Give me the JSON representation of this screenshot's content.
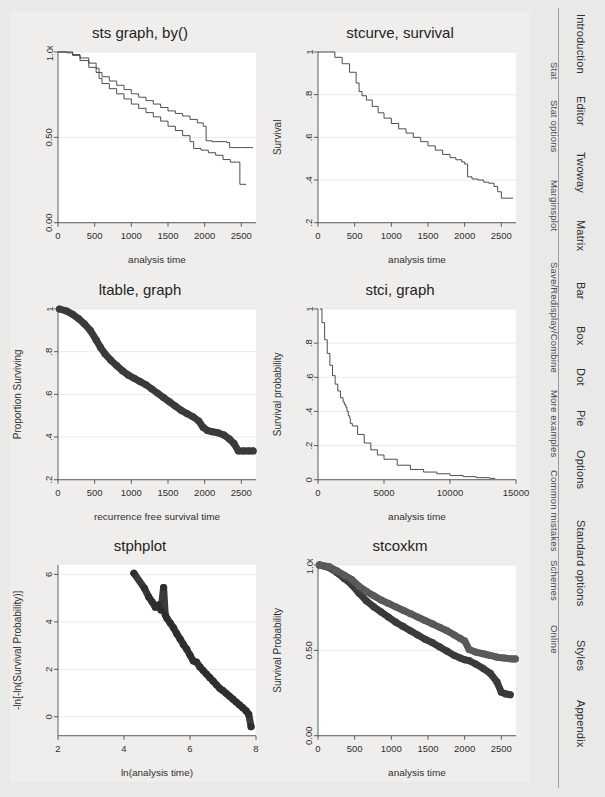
{
  "page": {
    "background_color": "#e9e9e7",
    "panel_color": "#efeeec"
  },
  "tab_rail": {
    "divider_color": "#9b9b9b",
    "outer_tabs": [
      {
        "label": "Introduction"
      },
      {
        "label": "Editor"
      },
      {
        "label": "Twoway"
      },
      {
        "label": "Matrix"
      },
      {
        "label": "Bar"
      },
      {
        "label": "Box"
      },
      {
        "label": "Dot"
      },
      {
        "label": "Pie"
      },
      {
        "label": "Options"
      },
      {
        "label": "Standard options"
      },
      {
        "label": "Styles"
      },
      {
        "label": "Appendix"
      }
    ],
    "inner_tabs": [
      {
        "label": "Stat"
      },
      {
        "label": "Stat options"
      },
      {
        "label": "Marginsplot"
      },
      {
        "label": "Save/Redisplay/Combine"
      },
      {
        "label": "More examples"
      },
      {
        "label": "Common mistakes"
      },
      {
        "label": "Schemes"
      },
      {
        "label": "Online"
      }
    ]
  },
  "chart_data": [
    {
      "id": "sts-graph-by",
      "type": "line",
      "title": "sts graph, by()",
      "xlabel": "analysis time",
      "ylabel": "",
      "xlim": [
        0,
        2700
      ],
      "ylim": [
        0,
        1.0
      ],
      "xticks": [
        0,
        500,
        1000,
        1500,
        2000,
        2500
      ],
      "xticklabels": [
        "0",
        "500",
        "1000",
        "1500",
        "2000",
        "2500"
      ],
      "yticks": [
        0.0,
        0.5,
        1.0
      ],
      "yticklabels": [
        "0.00",
        "0.50",
        "1.00"
      ],
      "grid": true,
      "legend": "none",
      "series": [
        {
          "name": "group 1",
          "color": "#3b3b3b",
          "x": [
            0,
            120,
            200,
            300,
            420,
            520,
            560,
            600,
            700,
            800,
            900,
            1000,
            1100,
            1200,
            1300,
            1400,
            1500,
            1600,
            1700,
            1800,
            1900,
            1980,
            2020,
            2100,
            2300,
            2340,
            2500,
            2660
          ],
          "y": [
            1.0,
            1.0,
            0.985,
            0.965,
            0.935,
            0.905,
            0.88,
            0.855,
            0.83,
            0.805,
            0.78,
            0.755,
            0.735,
            0.715,
            0.695,
            0.675,
            0.655,
            0.64,
            0.625,
            0.605,
            0.585,
            0.565,
            0.48,
            0.475,
            0.47,
            0.44,
            0.44,
            0.44
          ]
        },
        {
          "name": "group 2",
          "color": "#3b3b3b",
          "x": [
            0,
            120,
            200,
            300,
            420,
            520,
            560,
            600,
            700,
            800,
            900,
            1000,
            1100,
            1200,
            1300,
            1400,
            1500,
            1600,
            1700,
            1800,
            1850,
            1950,
            2050,
            2150,
            2250,
            2350,
            2450,
            2480,
            2560
          ],
          "y": [
            1.0,
            0.995,
            0.98,
            0.95,
            0.91,
            0.88,
            0.845,
            0.815,
            0.785,
            0.755,
            0.725,
            0.695,
            0.67,
            0.645,
            0.62,
            0.595,
            0.565,
            0.54,
            0.51,
            0.475,
            0.435,
            0.425,
            0.41,
            0.395,
            0.37,
            0.355,
            0.355,
            0.225,
            0.22
          ]
        }
      ]
    },
    {
      "id": "stcurve-survival",
      "type": "line",
      "title": "stcurve, survival",
      "xlabel": "analysis time",
      "ylabel": "Survival",
      "xlim": [
        0,
        2700
      ],
      "ylim": [
        0.2,
        1.0
      ],
      "xticks": [
        0,
        500,
        1000,
        1500,
        2000,
        2500
      ],
      "xticklabels": [
        "0",
        "500",
        "1000",
        "1500",
        "2000",
        "2500"
      ],
      "yticks": [
        0.2,
        0.4,
        0.6,
        0.8,
        1.0
      ],
      "yticklabels": [
        ".2",
        ".4",
        ".6",
        ".8",
        "1"
      ],
      "grid": true,
      "legend": "none",
      "series": [
        {
          "name": "survival",
          "color": "#3b3b3b",
          "x": [
            0,
            140,
            230,
            330,
            430,
            520,
            560,
            600,
            660,
            740,
            820,
            900,
            1000,
            1100,
            1200,
            1300,
            1400,
            1500,
            1600,
            1700,
            1800,
            1880,
            1960,
            2000,
            2040,
            2100,
            2180,
            2260,
            2330,
            2400,
            2450,
            2500,
            2660
          ],
          "y": [
            1.0,
            1.0,
            0.975,
            0.945,
            0.905,
            0.855,
            0.815,
            0.795,
            0.775,
            0.745,
            0.715,
            0.69,
            0.665,
            0.64,
            0.62,
            0.6,
            0.58,
            0.56,
            0.54,
            0.52,
            0.505,
            0.495,
            0.485,
            0.475,
            0.415,
            0.405,
            0.4,
            0.39,
            0.385,
            0.37,
            0.345,
            0.315,
            0.315
          ]
        }
      ]
    },
    {
      "id": "ltable-graph",
      "type": "scatter",
      "title": "ltable, graph",
      "xlabel": "recurrence free survival time",
      "ylabel": "Proportion Surviving",
      "xlim": [
        0,
        2700
      ],
      "ylim": [
        0.2,
        1.0
      ],
      "xticks": [
        0,
        500,
        1000,
        1500,
        2000,
        2500
      ],
      "xticklabels": [
        "0",
        "500",
        "1000",
        "1500",
        "2000",
        "2500"
      ],
      "yticks": [
        0.2,
        0.4,
        0.6,
        0.8,
        1.0
      ],
      "yticklabels": [
        ".2",
        ".4",
        ".6",
        ".8",
        "1"
      ],
      "grid": true,
      "legend": "none",
      "marker": "filled-circle",
      "series": [
        {
          "name": "proportion surviving",
          "color": "#3a3a3a",
          "x": [
            20,
            120,
            200,
            280,
            360,
            440,
            520,
            580,
            640,
            720,
            800,
            880,
            960,
            1040,
            1120,
            1200,
            1280,
            1360,
            1440,
            1520,
            1600,
            1680,
            1760,
            1840,
            1920,
            1980,
            2040,
            2100,
            2180,
            2260,
            2340,
            2400,
            2460,
            2530,
            2600,
            2660
          ],
          "y": [
            1.0,
            0.99,
            0.975,
            0.955,
            0.93,
            0.9,
            0.855,
            0.82,
            0.79,
            0.76,
            0.735,
            0.71,
            0.69,
            0.675,
            0.66,
            0.645,
            0.625,
            0.605,
            0.585,
            0.565,
            0.545,
            0.525,
            0.51,
            0.495,
            0.475,
            0.445,
            0.43,
            0.425,
            0.42,
            0.41,
            0.39,
            0.37,
            0.335,
            0.335,
            0.335,
            0.335
          ]
        }
      ]
    },
    {
      "id": "stci-graph",
      "type": "line",
      "title": "stci, graph",
      "xlabel": "analysis time",
      "ylabel": "Survival probability",
      "xlim": [
        0,
        15000
      ],
      "ylim": [
        0,
        1.0
      ],
      "xticks": [
        0,
        5000,
        10000,
        15000
      ],
      "xticklabels": [
        "0",
        "5000",
        "10000",
        "15000"
      ],
      "yticks": [
        0,
        0.2,
        0.4,
        0.6,
        0.8,
        1.0
      ],
      "yticklabels": [
        "0",
        ".2",
        ".4",
        ".6",
        ".8",
        "1"
      ],
      "grid": true,
      "legend": "none",
      "series": [
        {
          "name": "survival probability",
          "color": "#3b3b3b",
          "x": [
            150,
            300,
            500,
            700,
            900,
            1100,
            1300,
            1500,
            1700,
            1900,
            2000,
            2100,
            2200,
            2300,
            2400,
            2450,
            2600,
            3000,
            3500,
            4000,
            4500,
            5000,
            6000,
            7000,
            8000,
            9000,
            10000,
            11000,
            12000,
            13000,
            13400
          ],
          "y": [
            1.0,
            0.92,
            0.82,
            0.74,
            0.67,
            0.61,
            0.56,
            0.52,
            0.48,
            0.455,
            0.44,
            0.425,
            0.4,
            0.375,
            0.36,
            0.33,
            0.315,
            0.265,
            0.215,
            0.175,
            0.145,
            0.12,
            0.085,
            0.06,
            0.045,
            0.035,
            0.025,
            0.018,
            0.012,
            0.008,
            0.005
          ]
        }
      ]
    },
    {
      "id": "stphplot",
      "type": "scatter",
      "title": "stphplot",
      "xlabel": "ln(analysis time)",
      "ylabel": "-ln[-ln(Survival Probability)]",
      "xlim": [
        2,
        8
      ],
      "ylim": [
        -0.8,
        6.4
      ],
      "xticks": [
        2,
        4,
        6,
        8
      ],
      "xticklabels": [
        "2",
        "4",
        "6",
        "8"
      ],
      "yticks": [
        0,
        2,
        4,
        6
      ],
      "yticklabels": [
        "0",
        "2",
        "4",
        "6"
      ],
      "grid": true,
      "legend": "none",
      "marker": "filled-circle",
      "series": [
        {
          "name": "-ln[-ln S(t)]",
          "color": "#2e2e2e",
          "x": [
            4.3,
            4.62,
            4.75,
            4.85,
            4.95,
            5.05,
            5.12,
            5.2,
            5.25,
            5.3,
            5.4,
            5.5,
            5.6,
            5.7,
            5.8,
            5.9,
            6.0,
            6.1,
            6.2,
            6.3,
            6.4,
            6.5,
            6.6,
            6.7,
            6.8,
            6.9,
            7.0,
            7.1,
            7.2,
            7.3,
            7.4,
            7.5,
            7.6,
            7.7,
            7.78,
            7.85
          ],
          "y": [
            6.05,
            5.42,
            5.05,
            4.85,
            4.62,
            4.72,
            4.5,
            5.45,
            4.3,
            4.15,
            3.95,
            3.75,
            3.5,
            3.28,
            3.05,
            2.85,
            2.6,
            2.35,
            2.3,
            2.1,
            1.95,
            1.8,
            1.65,
            1.5,
            1.35,
            1.2,
            1.1,
            0.98,
            0.86,
            0.74,
            0.62,
            0.5,
            0.38,
            0.25,
            0.1,
            -0.42
          ]
        }
      ]
    },
    {
      "id": "stcoxkm",
      "type": "scatter",
      "title": "stcoxkm",
      "xlabel": "analysis time",
      "ylabel": "Survival Probability",
      "xlim": [
        0,
        2700
      ],
      "ylim": [
        0,
        1.0
      ],
      "xticks": [
        0,
        500,
        1000,
        1500,
        2000,
        2500
      ],
      "xticklabels": [
        "0",
        "500",
        "1000",
        "1500",
        "2000",
        "2500"
      ],
      "yticks": [
        0.0,
        0.5,
        1.0
      ],
      "yticklabels": [
        "0.00",
        "0.50",
        "1.00"
      ],
      "grid": true,
      "legend": "none",
      "marker": "filled-circle",
      "series": [
        {
          "name": "observed",
          "color": "#3a3a3a",
          "x": [
            20,
            150,
            260,
            360,
            460,
            560,
            660,
            760,
            860,
            960,
            1060,
            1160,
            1260,
            1360,
            1460,
            1560,
            1660,
            1760,
            1860,
            1940,
            2000,
            2060,
            2150,
            2250,
            2350,
            2440,
            2500,
            2560,
            2620
          ],
          "y": [
            1.0,
            0.985,
            0.955,
            0.92,
            0.885,
            0.835,
            0.79,
            0.755,
            0.725,
            0.695,
            0.665,
            0.64,
            0.615,
            0.59,
            0.565,
            0.545,
            0.52,
            0.495,
            0.47,
            0.455,
            0.445,
            0.44,
            0.42,
            0.395,
            0.365,
            0.315,
            0.255,
            0.245,
            0.24
          ]
        },
        {
          "name": "predicted",
          "color": "#5a5a5a",
          "x": [
            20,
            150,
            260,
            360,
            460,
            560,
            660,
            760,
            860,
            960,
            1060,
            1160,
            1260,
            1360,
            1460,
            1560,
            1660,
            1760,
            1860,
            1940,
            2000,
            2060,
            2150,
            2250,
            2350,
            2440,
            2540,
            2640,
            2690
          ],
          "y": [
            1.0,
            0.99,
            0.965,
            0.94,
            0.915,
            0.875,
            0.845,
            0.82,
            0.795,
            0.775,
            0.755,
            0.735,
            0.715,
            0.695,
            0.675,
            0.655,
            0.635,
            0.615,
            0.59,
            0.57,
            0.555,
            0.505,
            0.49,
            0.48,
            0.47,
            0.46,
            0.455,
            0.45,
            0.45
          ]
        }
      ]
    }
  ]
}
